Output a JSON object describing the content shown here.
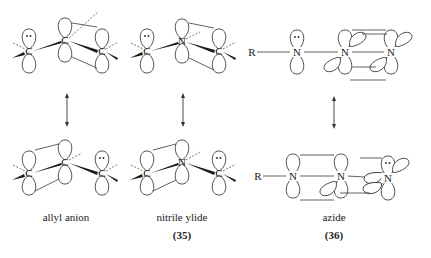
{
  "figure": {
    "type": "resonance-orbital-diagram",
    "structures": [
      {
        "id": "allyl",
        "name": "allyl anion",
        "number": "",
        "atoms_top": [
          "C",
          "C",
          "C"
        ],
        "atoms_bottom": [
          "C",
          "C",
          "C"
        ],
        "lone_pair_top": "left",
        "lone_pair_bottom": "right"
      },
      {
        "id": "nitrile-ylide",
        "name": "nitrile ylide",
        "number": "(35)",
        "atoms_top": [
          "C",
          "N",
          "C"
        ],
        "atoms_bottom": [
          "C",
          "N",
          "C"
        ],
        "lone_pair_top": "left",
        "lone_pair_bottom": "right"
      },
      {
        "id": "azide",
        "name": "azide",
        "number": "(36)",
        "substituent": "R",
        "atoms_top": [
          "N",
          "N",
          "N"
        ],
        "atoms_bottom": [
          "N",
          "N",
          "N"
        ],
        "lone_pair_top": "left",
        "lone_pair_bottom": "right"
      }
    ],
    "resonance_arrow": "↕",
    "lone_pair_symbol": "••"
  }
}
